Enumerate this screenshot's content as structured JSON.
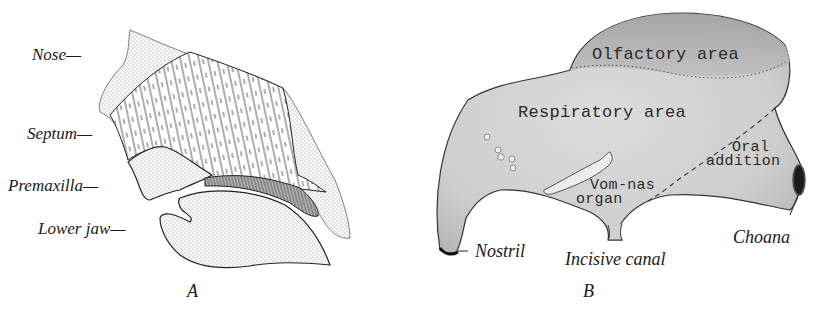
{
  "figure": {
    "panel_a": {
      "caption": "A",
      "labels": {
        "nose": "Nose—",
        "septum": "Septum—",
        "premaxilla": "Premaxilla—",
        "lower_jaw": "Lower jaw—"
      }
    },
    "panel_b": {
      "caption": "B",
      "regions": {
        "olfactory": "Olfactory area",
        "respiratory": "Respiratory area",
        "oral_1": "Oral",
        "oral_2": "addition",
        "vom_1": "Vom-nas",
        "vom_2": "organ"
      },
      "labels": {
        "nostril": "Nostril",
        "incisive_canal": "Incisive canal",
        "choana": "Choana"
      }
    },
    "colors": {
      "ink": "#1a1a1a",
      "stipple": "#f2f2f2",
      "shaded_body": "#d6d6d6",
      "shaded_dark": "#a8a8a8",
      "background": "#ffffff"
    }
  }
}
